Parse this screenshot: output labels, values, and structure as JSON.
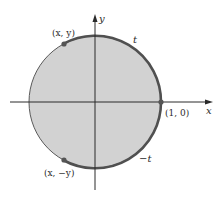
{
  "diagram": {
    "type": "unit-circle",
    "colors": {
      "fill": "#d2d2d2",
      "thin_stroke": "#5a5a5a",
      "arc_stroke": "#505050",
      "axis": "#2a2a2a",
      "point": "#555555"
    },
    "axes": {
      "x_label": "x",
      "y_label": "y"
    },
    "points": [
      {
        "id": "p-xy",
        "label": "(x, y)"
      },
      {
        "id": "p-10",
        "label": "(1, 0)"
      },
      {
        "id": "p-xny",
        "label": "(x, −y)"
      }
    ],
    "arcs": [
      {
        "id": "arc-t",
        "label": "t"
      },
      {
        "id": "arc-neg-t",
        "label": "−t"
      }
    ]
  }
}
